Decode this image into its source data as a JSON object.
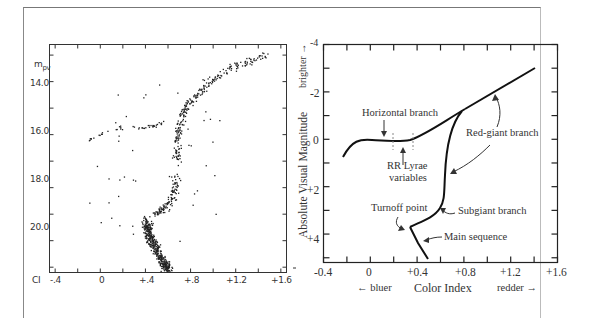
{
  "chart_data": [
    {
      "type": "scatter",
      "title": "",
      "xlabel": "CI",
      "ylabel": "m_pv",
      "x_ticks": [
        "-.4",
        "0",
        "+.4",
        "+.8",
        "+1.2",
        "+1.6"
      ],
      "y_ticks": [
        "14.0",
        "16.0",
        "18.0",
        "20.0"
      ],
      "xlim": [
        -0.45,
        1.65
      ],
      "ylim": [
        21.2,
        12.6
      ],
      "y_inverted": true,
      "grid": false,
      "description": "Color-magnitude diagram of a globular cluster: dense main sequence near CI +0.4..+0.6 at m 19-21, subgiant/red-giant branch rising to +1.5 at m~13, horizontal branch at m~15.7 from CI 0 to +0.6",
      "series": [
        {
          "name": "horizontal branch (blue)",
          "points": [
            [
              -0.1,
              16.2
            ],
            [
              -0.05,
              16.0
            ],
            [
              0,
              15.95
            ],
            [
              0.05,
              15.85
            ],
            [
              0.1,
              15.8
            ],
            [
              0.15,
              15.75
            ],
            [
              0.2,
              15.7
            ]
          ]
        },
        {
          "name": "horizontal branch (red)",
          "points": [
            [
              0.3,
              15.7
            ],
            [
              0.35,
              15.72
            ],
            [
              0.4,
              15.7
            ],
            [
              0.45,
              15.65
            ],
            [
              0.5,
              15.6
            ],
            [
              0.55,
              15.5
            ]
          ]
        },
        {
          "name": "red-giant branch",
          "points": [
            [
              0.68,
              17.0
            ],
            [
              0.67,
              16.5
            ],
            [
              0.68,
              16.0
            ],
            [
              0.7,
              15.5
            ],
            [
              0.75,
              15.0
            ],
            [
              0.85,
              14.5
            ],
            [
              0.95,
              14.0
            ],
            [
              1.1,
              13.6
            ],
            [
              1.3,
              13.2
            ],
            [
              1.5,
              12.9
            ]
          ]
        },
        {
          "name": "subgiant branch",
          "points": [
            [
              0.68,
              17.5
            ],
            [
              0.66,
              18.0
            ],
            [
              0.62,
              18.5
            ],
            [
              0.55,
              18.8
            ],
            [
              0.48,
              19.0
            ]
          ]
        },
        {
          "name": "main sequence",
          "points": [
            [
              0.4,
              19.2
            ],
            [
              0.42,
              19.6
            ],
            [
              0.45,
              20.0
            ],
            [
              0.5,
              20.4
            ],
            [
              0.55,
              20.8
            ],
            [
              0.6,
              21.1
            ]
          ]
        }
      ]
    },
    {
      "type": "line",
      "title": "",
      "xlabel": "Color Index",
      "ylabel": "Absolute Visual Magnitude",
      "x_ticks": [
        "-0.4",
        "0",
        "+0.4",
        "+0.8",
        "+1.2",
        "+1.6"
      ],
      "y_ticks": [
        "-4",
        "-2",
        "0",
        "+2",
        "+4"
      ],
      "xlim": [
        -0.4,
        1.6
      ],
      "ylim": [
        5.2,
        -4
      ],
      "y_inverted": true,
      "grid": false,
      "x_hints": {
        "left": "bluer",
        "right": "redder"
      },
      "y_hint": "brighter",
      "series": [
        {
          "name": "Horizontal branch",
          "points": [
            [
              -0.24,
              1.2
            ],
            [
              -0.15,
              0.3
            ],
            [
              0,
              0.05
            ],
            [
              0.2,
              0.05
            ],
            [
              0.32,
              0.0
            ],
            [
              0.45,
              -0.4
            ],
            [
              0.6,
              -1.0
            ],
            [
              0.78,
              -1.6
            ]
          ]
        },
        {
          "name": "Red-giant branch",
          "points": [
            [
              0.78,
              -1.6
            ],
            [
              1.0,
              -2.1
            ],
            [
              1.2,
              -2.6
            ],
            [
              1.4,
              -3.1
            ]
          ]
        },
        {
          "name": "Giant/subgiant track",
          "points": [
            [
              0.78,
              -1.6
            ],
            [
              0.7,
              -1.0
            ],
            [
              0.65,
              0.0
            ],
            [
              0.64,
              1.0
            ],
            [
              0.64,
              2.0
            ],
            [
              0.6,
              2.5
            ],
            [
              0.52,
              3.0
            ],
            [
              0.43,
              3.3
            ],
            [
              0.34,
              3.6
            ]
          ]
        },
        {
          "name": "Main sequence",
          "points": [
            [
              0.34,
              3.6
            ],
            [
              0.4,
              4.2
            ],
            [
              0.48,
              5.0
            ]
          ]
        }
      ],
      "annotations": [
        "Horizontal branch",
        "RR Lyrae variables",
        "Red-giant branch",
        "Turnoff point",
        "Subgiant branch",
        "Main sequence"
      ]
    }
  ],
  "left_plot": {
    "y_label": "m",
    "y_label_sub": "pv",
    "x_axis_label": "CI",
    "x_ticks": [
      "-.4",
      "0",
      "+.4",
      "+.8",
      "+1.2",
      "+1.6"
    ],
    "y_ticks": [
      "14.0",
      "16.0",
      "18.0",
      "20.0"
    ]
  },
  "right_plot": {
    "y_axis_label": "Absolute Visual Magnitude",
    "y_hint": "brighter",
    "x_axis_label": "Color Index",
    "x_hint_left": "bluer",
    "x_hint_right": "redder",
    "x_ticks": [
      "-0.4",
      "0",
      "+0.4",
      "+0.8",
      "+1.2",
      "+1.6"
    ],
    "y_ticks": [
      "-4",
      "-2",
      "0",
      "+2",
      "+4"
    ],
    "annotations": {
      "horizontal_branch": "Horizontal branch",
      "rr_lyrae_1": "RR Lyrae",
      "rr_lyrae_2": "variables",
      "red_giant": "Red-giant branch",
      "turnoff": "Turnoff point",
      "subgiant": "Subgiant branch",
      "main_sequence": "Main sequence"
    },
    "arrows": {
      "left": "←",
      "right": "→",
      "up": "→"
    }
  }
}
